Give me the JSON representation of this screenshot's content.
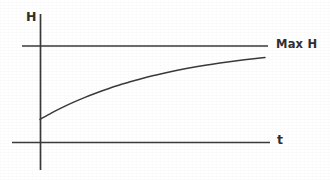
{
  "figure": {
    "kind": "line-chart-diagram",
    "background_color": "#ffffff",
    "ink_color": "#3a3a3a"
  },
  "labels": {
    "y_axis": "H",
    "x_axis": "t",
    "asymptote": "Max H"
  },
  "chart_data": {
    "type": "line",
    "title": "",
    "subtitle": "",
    "xlabel": "t",
    "ylabel": "H",
    "grid": false,
    "legend": null,
    "xlim": [
      0,
      1
    ],
    "ylim": [
      0,
      1
    ],
    "axis_tick_labels": {
      "x": [],
      "y": []
    },
    "annotations": [
      {
        "text": "Max H",
        "kind": "asymptote-label",
        "position": "right",
        "value": 1.0
      },
      {
        "text": "H",
        "kind": "axis-label",
        "position": "top-left"
      },
      {
        "text": "t",
        "kind": "axis-label",
        "position": "right"
      }
    ],
    "reference_lines": [
      {
        "name": "max-h-asymptote",
        "orientation": "horizontal",
        "value": 1.0,
        "label": "Max H"
      }
    ],
    "series": [
      {
        "name": "H(t)",
        "description": "exponential approach to Max H",
        "x": [
          0.0,
          0.05,
          0.1,
          0.15,
          0.2,
          0.25,
          0.3,
          0.35,
          0.4,
          0.45,
          0.5,
          0.55,
          0.6,
          0.65,
          0.7,
          0.75,
          0.8,
          0.85,
          0.9,
          0.95,
          1.0
        ],
        "values": [
          0.24,
          0.305,
          0.364,
          0.418,
          0.468,
          0.513,
          0.555,
          0.593,
          0.629,
          0.661,
          0.691,
          0.718,
          0.743,
          0.766,
          0.787,
          0.806,
          0.824,
          0.84,
          0.855,
          0.869,
          0.881
        ]
      }
    ]
  }
}
